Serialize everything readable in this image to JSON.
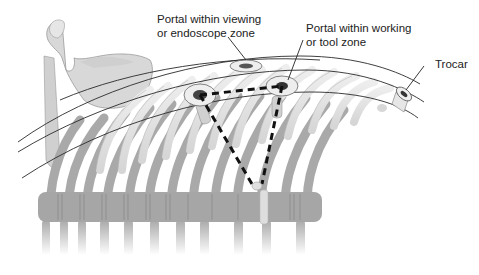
{
  "figure": {
    "colors": {
      "bone_light": "#e6e6e6",
      "bone_mid": "#c8c8c8",
      "bone_dark": "#a9a9a9",
      "spine": "#a6a6a6",
      "outline": "#222222",
      "portal_ring": "#eeeeee",
      "portal_center": "#333333",
      "dashed_line": "#111111"
    }
  },
  "labels": {
    "viewing_portal": {
      "line1": "Portal within viewing",
      "line2": "or endoscope zone"
    },
    "working_portal": {
      "line1": "Portal within working",
      "line2": "or tool zone"
    },
    "trocar": {
      "text": "Trocar"
    }
  }
}
